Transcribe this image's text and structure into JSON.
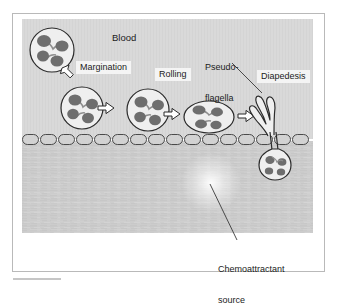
{
  "figure": {
    "panel_label_blood": "Blood",
    "colors": {
      "frame_border": "#b9b9b9",
      "blood_background": "#d9d9d9",
      "tissue_background": "#cfcfcf",
      "cell_outline": "#2b2b2b",
      "cell_cytoplasm": "#efefef",
      "cell_nucleus": "#6e6e6e",
      "endothelium_fill": "#d2d2d2",
      "endothelium_outline": "#3a3a3a",
      "label_background": "#f4f4f4",
      "label_text": "#1b1b1b",
      "leader_line": "#3a3a3a",
      "chemoattractant_glow": "#ffffff"
    }
  },
  "labels": {
    "blood": "Blood",
    "margination": "Margination",
    "rolling": "Rolling",
    "pseudoflagella_line1": "Pseudo-",
    "pseudoflagella_line2": "flagella",
    "diapedesis": "Diapedesis",
    "chemoattractant_line1": "Chemoattractant",
    "chemoattractant_line2": "source"
  },
  "cells": [
    {
      "id": "cell-circulating",
      "name": "circulating-leukocyte",
      "shape": "circle",
      "cx": 52,
      "cy": 50,
      "rx": 22,
      "ry": 22,
      "nucleus_lobes": 4
    },
    {
      "id": "cell-marginating",
      "name": "marginating-leukocyte",
      "shape": "circle",
      "cx": 82,
      "cy": 107,
      "rx": 21,
      "ry": 21,
      "nucleus_lobes": 4
    },
    {
      "id": "cell-adhering",
      "name": "adhering-leukocyte",
      "shape": "circle",
      "cx": 148,
      "cy": 110,
      "rx": 21,
      "ry": 21,
      "nucleus_lobes": 4
    },
    {
      "id": "cell-rolling",
      "name": "rolling-leukocyte",
      "shape": "ellipse",
      "cx": 209,
      "cy": 116,
      "rx": 24,
      "ry": 16,
      "nucleus_lobes": 4
    },
    {
      "id": "cell-migrated",
      "name": "migrated-leukocyte",
      "shape": "teardrop",
      "cx": 279,
      "cy": 161,
      "rx": 15,
      "ry": 16,
      "nucleus_lobes": 4
    }
  ],
  "arrows": [
    {
      "name": "arrow-margination-entry",
      "type": "block-arrow-diagonal",
      "from_x": 62,
      "from_y": 71,
      "to_x": 76,
      "to_y": 85
    },
    {
      "name": "arrow-to-adhering",
      "type": "block-arrow-right",
      "x": 111,
      "y": 110
    },
    {
      "name": "arrow-to-rolling",
      "type": "block-arrow-right",
      "x": 177,
      "y": 115
    },
    {
      "name": "arrow-to-diapedesis",
      "type": "block-arrow-right",
      "x": 243,
      "y": 117
    }
  ],
  "annotations": [
    {
      "name": "pseudoflagella-leader",
      "from_x": 232,
      "from_y": 64,
      "to_x": 262,
      "to_y": 92
    },
    {
      "name": "chemoattractant-leader",
      "from_x": 236,
      "from_y": 241,
      "to_x": 211,
      "to_y": 185
    }
  ],
  "regions": {
    "blood_top": 19,
    "endothelium_y": 134,
    "endothelium_cell_count": 17,
    "tissue_top": 146,
    "tissue_bottom": 233,
    "panel_left": 22,
    "panel_right": 313
  },
  "chemoattractant_source": {
    "name": "chemoattractant-glow",
    "cx": 211,
    "cy": 183,
    "radius": 26
  }
}
